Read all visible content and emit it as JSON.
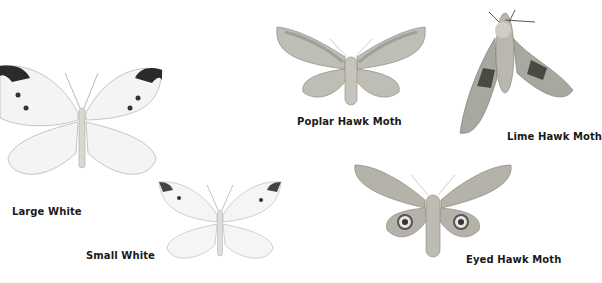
{
  "specimens": [
    {
      "id": "large-white",
      "label": "Large White"
    },
    {
      "id": "small-white",
      "label": "Small White"
    },
    {
      "id": "poplar-hawk-moth",
      "label": "Poplar Hawk Moth"
    },
    {
      "id": "lime-hawk-moth",
      "label": "Lime Hawk Moth"
    },
    {
      "id": "eyed-hawk-moth",
      "label": "Eyed Hawk Moth"
    }
  ]
}
